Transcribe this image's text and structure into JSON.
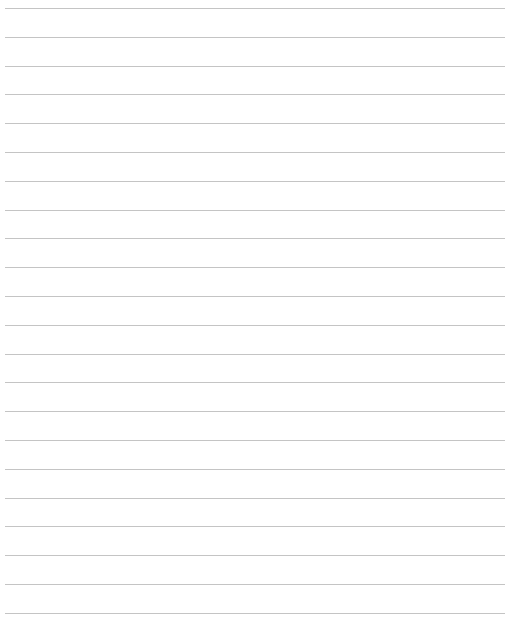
{
  "page": {
    "type": "lined-paper",
    "background_color": "#ffffff",
    "line_color": "#c4c4c4",
    "line_count": 22,
    "first_line_y": 8,
    "line_spacing": 28.8,
    "line_left": 5,
    "line_width": 500
  }
}
